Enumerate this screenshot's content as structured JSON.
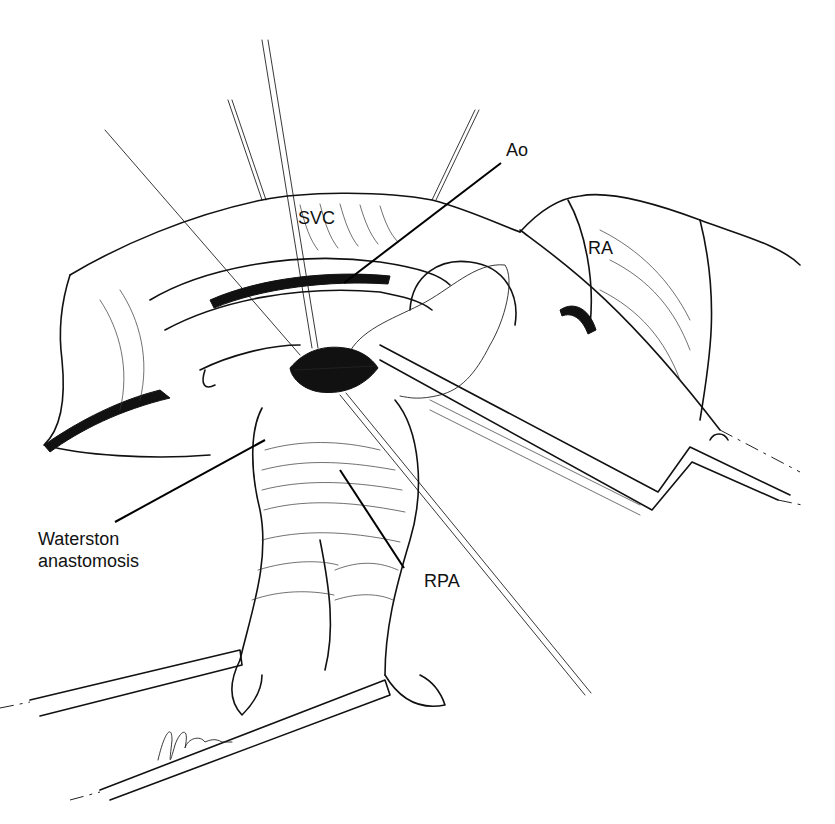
{
  "figure": {
    "background": "#ffffff",
    "ink_color": "#111111"
  },
  "labels": {
    "svc": "SVC",
    "ao": "Ao",
    "ra": "RA",
    "waterston_line1": "Waterston",
    "waterston_line2": "anastomosis",
    "rpa": "RPA"
  },
  "signature": "R. Idris"
}
